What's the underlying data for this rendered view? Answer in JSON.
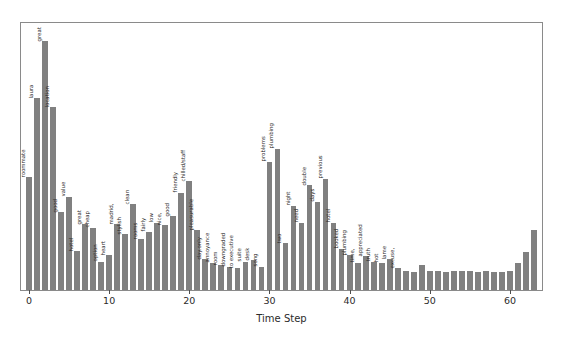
{
  "chart_data": {
    "type": "bar",
    "title": "",
    "xlabel": "Time Step",
    "ylabel": "",
    "xlim": [
      -1,
      64
    ],
    "ylim": [
      0,
      1.03
    ],
    "grid": false,
    "legend": null,
    "bar_color": "#808080",
    "xticks": [
      0,
      10,
      20,
      30,
      40,
      50,
      60
    ],
    "xticklabels": [
      "0",
      "10",
      "20",
      "30",
      "40",
      "50",
      "60"
    ],
    "x": [
      0,
      1,
      2,
      3,
      4,
      5,
      6,
      7,
      8,
      9,
      10,
      11,
      12,
      13,
      14,
      15,
      16,
      17,
      18,
      19,
      20,
      21,
      22,
      23,
      24,
      25,
      26,
      27,
      28,
      29,
      30,
      31,
      32,
      33,
      34,
      35,
      36,
      37,
      38,
      39,
      40,
      41,
      42,
      43,
      44,
      45,
      46,
      47,
      48,
      49,
      50,
      51,
      52,
      53,
      54,
      55,
      56,
      57,
      58,
      59,
      60,
      61,
      62,
      63
    ],
    "values": [
      0.435,
      0.74,
      0.96,
      0.705,
      0.3,
      0.36,
      0.15,
      0.255,
      0.24,
      0.11,
      0.135,
      0.255,
      0.215,
      0.33,
      0.195,
      0.225,
      0.26,
      0.25,
      0.285,
      0.375,
      0.42,
      0.23,
      0.12,
      0.105,
      0.095,
      0.09,
      0.085,
      0.11,
      0.115,
      0.09,
      0.495,
      0.545,
      0.18,
      0.325,
      0.26,
      0.405,
      0.34,
      0.43,
      0.26,
      0.16,
      0.135,
      0.105,
      0.13,
      0.11,
      0.105,
      0.12,
      0.085,
      0.075,
      0.07,
      0.095,
      0.075,
      0.072,
      0.07,
      0.072,
      0.075,
      0.072,
      0.07,
      0.072,
      0.07,
      0.07,
      0.075,
      0.105,
      0.145,
      0.23
    ],
    "point_labels": [
      "roommate",
      "laura",
      "great",
      "location",
      "good",
      "value",
      "hotel",
      "great",
      "cheap",
      "option",
      "heart",
      "madrid,",
      "stylish",
      "clean",
      "rooms",
      "fairly",
      "low",
      "nice,",
      "good",
      "friendly",
      "chilled/staff",
      "pleasurable",
      "day.only",
      "annoyance",
      "room",
      "downgraded",
      "to executive",
      "suite",
      "desk",
      "song",
      "problems",
      "plumbing",
      "two",
      "night",
      "need",
      "double",
      "days",
      "previous",
      "hotel",
      "booked",
      "plumbing",
      "time,",
      "appreciated",
      "truth",
      "hot",
      "lame",
      "excuse,",
      "",
      "",
      "",
      "",
      "",
      "",
      "",
      "",
      "",
      "",
      "",
      "",
      "",
      "",
      "",
      "",
      ""
    ]
  }
}
